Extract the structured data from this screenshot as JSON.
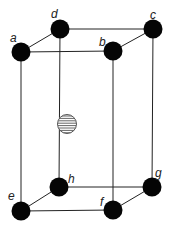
{
  "diagram": {
    "type": "unit-cell",
    "colors": {
      "atom": "#050505",
      "edge": "#222222",
      "stripe": "#555555",
      "background": "#ffffff"
    },
    "corner_atoms": [
      {
        "id": "a",
        "label": "a",
        "cx": 21,
        "cy": 52,
        "lx": 10,
        "ly": 42
      },
      {
        "id": "b",
        "label": "b",
        "cx": 113,
        "cy": 51,
        "lx": 99,
        "ly": 46
      },
      {
        "id": "c",
        "label": "c",
        "cx": 153,
        "cy": 29,
        "lx": 150,
        "ly": 19
      },
      {
        "id": "d",
        "label": "d",
        "cx": 60,
        "cy": 29,
        "lx": 51,
        "ly": 18
      },
      {
        "id": "e",
        "label": "e",
        "cx": 21,
        "cy": 211,
        "lx": 8,
        "ly": 200
      },
      {
        "id": "f",
        "label": "f",
        "cx": 113,
        "cy": 210,
        "lx": 100,
        "ly": 206
      },
      {
        "id": "g",
        "label": "g",
        "cx": 152,
        "cy": 187,
        "lx": 155,
        "ly": 177
      },
      {
        "id": "h",
        "label": "h",
        "cx": 59,
        "cy": 187,
        "lx": 68,
        "ly": 183
      }
    ],
    "center_atom": {
      "id": "center",
      "cx": 67,
      "cy": 124,
      "r": 9.5,
      "pattern": "horizontal-stripes"
    },
    "atom_radius": 9.5,
    "edges": [
      [
        "a",
        "b"
      ],
      [
        "b",
        "c"
      ],
      [
        "c",
        "d"
      ],
      [
        "d",
        "a"
      ],
      [
        "e",
        "f"
      ],
      [
        "f",
        "g"
      ],
      [
        "g",
        "h"
      ],
      [
        "h",
        "e"
      ],
      [
        "a",
        "e"
      ],
      [
        "b",
        "f"
      ],
      [
        "c",
        "g"
      ],
      [
        "d",
        "h"
      ]
    ]
  }
}
